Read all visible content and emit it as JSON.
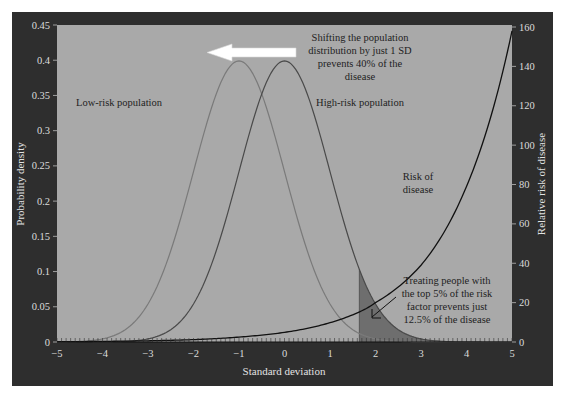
{
  "chart_data": {
    "type": "line",
    "title": "",
    "xlabel": "Standard deviation",
    "ylabel": "Probability density",
    "ylabel_right": "Relative risk of disease",
    "xlim": [
      -5,
      5
    ],
    "ylim": [
      0,
      0.45
    ],
    "ylim_right": [
      0,
      160
    ],
    "x_ticks": [
      "−5",
      "−4",
      "−3",
      "−2",
      "−1",
      "0",
      "1",
      "2",
      "3",
      "4",
      "5"
    ],
    "y_ticks": [
      "0",
      "0.05",
      "0.1",
      "0.15",
      "0.2",
      "0.25",
      "0.3",
      "0.35",
      "0.4",
      "0.45"
    ],
    "y_ticks_right": [
      "0",
      "20",
      "40",
      "60",
      "80",
      "100",
      "120",
      "140",
      "160"
    ],
    "grid": false,
    "series": [
      {
        "name": "Low-risk population",
        "kind": "normal",
        "mean": -1,
        "sd": 1,
        "axis": "left",
        "color": "#7a7a7a",
        "peak": 0.399
      },
      {
        "name": "High-risk population",
        "kind": "normal",
        "mean": 0,
        "sd": 1,
        "axis": "left",
        "color": "#4a4a4a",
        "peak": 0.399
      },
      {
        "name": "Risk of disease",
        "kind": "exponential",
        "axis": "right",
        "color": "#111111",
        "x": [
          -5,
          -4,
          -3,
          -2,
          -1,
          0,
          1,
          1.8,
          2,
          3,
          4,
          5
        ],
        "values": [
          0.15,
          0.31,
          0.62,
          1.2,
          2.5,
          4.9,
          9.8,
          17,
          20,
          39,
          79,
          158
        ]
      }
    ],
    "shaded_region": {
      "from_x": 1.645,
      "to_x": 5,
      "under": "High-risk population",
      "color": "#6e6e6e"
    },
    "annotations": [
      {
        "id": "shift",
        "lines": [
          "Shifting the population",
          "distribution by just 1 SD",
          "prevents 40% of the",
          "disease"
        ],
        "arrow": "left",
        "arrow_from": [
          -0.5,
          0.405
        ],
        "arrow_to": [
          -2.4,
          0.405
        ]
      },
      {
        "id": "low_risk_label",
        "lines": [
          "Low-risk population"
        ]
      },
      {
        "id": "high_risk_label",
        "lines": [
          "High-risk population"
        ]
      },
      {
        "id": "risk_label",
        "lines": [
          "Risk of",
          "disease"
        ]
      },
      {
        "id": "treat",
        "lines": [
          "Treating people with",
          "the top 5% of the risk",
          "factor prevents just",
          "12.5% of the disease"
        ]
      }
    ],
    "colors": {
      "frame": "#2e2e2e",
      "plot_bg": "#a9a9a9",
      "text_light": "#dcdcdc",
      "text_dark": "#1e1e1e"
    }
  }
}
